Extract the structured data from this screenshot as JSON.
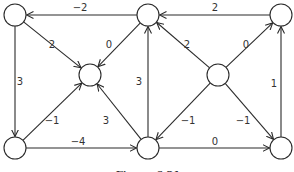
{
  "diagram": {
    "type": "directed-weighted-graph",
    "caption": "Figure 6.21",
    "node_radius": 11,
    "stroke_color": "#2a2a2a",
    "nodes": [
      {
        "id": "A",
        "x": 15,
        "y": 15
      },
      {
        "id": "B",
        "x": 148,
        "y": 15
      },
      {
        "id": "C",
        "x": 281,
        "y": 15
      },
      {
        "id": "D",
        "x": 90,
        "y": 75
      },
      {
        "id": "E",
        "x": 218,
        "y": 75
      },
      {
        "id": "F",
        "x": 15,
        "y": 148
      },
      {
        "id": "G",
        "x": 148,
        "y": 148
      },
      {
        "id": "H",
        "x": 281,
        "y": 148
      }
    ],
    "edges": [
      {
        "from": "B",
        "to": "A",
        "weight": "−2",
        "lx": 80,
        "ly": 8
      },
      {
        "from": "C",
        "to": "B",
        "weight": "2",
        "lx": 215,
        "ly": 8
      },
      {
        "from": "A",
        "to": "D",
        "weight": "2",
        "lx": 52,
        "ly": 45
      },
      {
        "from": "B",
        "to": "D",
        "weight": "0",
        "lx": 109,
        "ly": 45
      },
      {
        "from": "A",
        "to": "F",
        "weight": "3",
        "lx": 20,
        "ly": 82
      },
      {
        "from": "G",
        "to": "B",
        "weight": "3",
        "lx": 139,
        "ly": 82
      },
      {
        "from": "E",
        "to": "B",
        "weight": "2",
        "lx": 187,
        "ly": 45
      },
      {
        "from": "E",
        "to": "C",
        "weight": "0",
        "lx": 246,
        "ly": 45
      },
      {
        "from": "H",
        "to": "C",
        "weight": "1",
        "lx": 274,
        "ly": 84
      },
      {
        "from": "F",
        "to": "D",
        "weight": "−1",
        "lx": 52,
        "ly": 121
      },
      {
        "from": "G",
        "to": "D",
        "weight": "3",
        "lx": 106,
        "ly": 121
      },
      {
        "from": "F",
        "to": "G",
        "weight": "−4",
        "lx": 78,
        "ly": 142
      },
      {
        "from": "E",
        "to": "G",
        "weight": "−1",
        "lx": 188,
        "ly": 121
      },
      {
        "from": "E",
        "to": "H",
        "weight": "−1",
        "lx": 243,
        "ly": 121
      },
      {
        "from": "G",
        "to": "H",
        "weight": "0",
        "lx": 215,
        "ly": 142
      }
    ]
  }
}
